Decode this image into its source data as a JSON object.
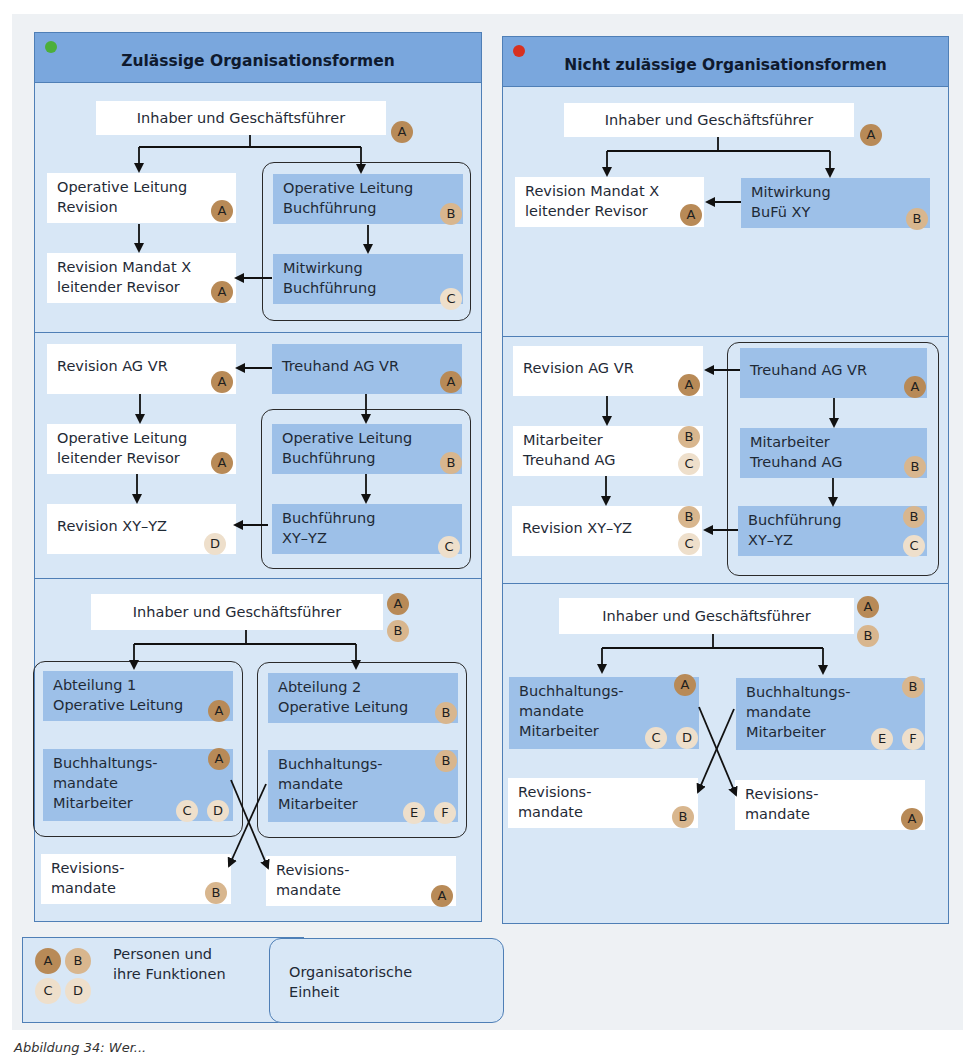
{
  "colors": {
    "header_bg": "#7aa7dd",
    "panel_bg": "#d8e7f6",
    "panel_border": "#4f7fb6",
    "node_blue": "#9dc0e8",
    "badge_A": "#b88a57",
    "badge_B": "#d8b68e",
    "badge_light": "#eedfcb",
    "dot_allowed": "#4caf3a",
    "dot_not_allowed": "#d8311f"
  },
  "left_panel": {
    "title": "Zulässige Organisationsformen",
    "status_icon": "green-dot",
    "sections": [
      {
        "nodes": [
          {
            "id": "owner",
            "text": "Inhaber und Geschäftsführer",
            "style": "white",
            "badges": [
              "A"
            ]
          },
          {
            "id": "op-rev",
            "text": "Operative Leitung\nRevision",
            "style": "white",
            "badges": [
              "A"
            ]
          },
          {
            "id": "rev-mandat",
            "text": "Revision Mandat X\nleitender Revisor",
            "style": "white",
            "badges": [
              "A"
            ]
          },
          {
            "id": "op-buch",
            "text": "Operative Leitung\nBuchführung",
            "style": "blue",
            "badges": [
              "B"
            ]
          },
          {
            "id": "mit-buch",
            "text": "Mitwirkung\nBuchführung",
            "style": "blue",
            "badges": [
              "C"
            ]
          }
        ]
      },
      {
        "nodes": [
          {
            "id": "rev-ag",
            "text": "Revision AG VR",
            "style": "white",
            "badges": [
              "A"
            ]
          },
          {
            "id": "treu-ag",
            "text": "Treuhand AG VR",
            "style": "blue",
            "badges": [
              "A"
            ]
          },
          {
            "id": "op-lead",
            "text": "Operative Leitung\nleitender Revisor",
            "style": "white",
            "badges": [
              "A"
            ]
          },
          {
            "id": "op-buch2",
            "text": "Operative Leitung\nBuchführung",
            "style": "blue",
            "badges": [
              "B"
            ]
          },
          {
            "id": "rev-xy",
            "text": "Revision XY–YZ",
            "style": "white",
            "badges": [
              "D"
            ]
          },
          {
            "id": "buch-xy",
            "text": "Buchführung\nXY–YZ",
            "style": "blue",
            "badges": [
              "C"
            ]
          }
        ]
      },
      {
        "nodes": [
          {
            "id": "owner3",
            "text": "Inhaber und Geschäftsführer",
            "style": "white",
            "badges": [
              "A",
              "B"
            ]
          },
          {
            "id": "abt1",
            "text": "Abteilung 1\nOperative Leitung",
            "style": "blue",
            "badges": [
              "A"
            ]
          },
          {
            "id": "abt2",
            "text": "Abteilung 2\nOperative Leitung",
            "style": "blue",
            "badges": [
              "B"
            ]
          },
          {
            "id": "bh1",
            "text": "Buchhaltungs-\nmandate\nMitarbeiter",
            "style": "blue",
            "badges": [
              "A",
              "C",
              "D"
            ]
          },
          {
            "id": "bh2",
            "text": "Buchhaltungs-\nmandate\nMitarbeiter",
            "style": "blue",
            "badges": [
              "B",
              "E",
              "F"
            ]
          },
          {
            "id": "revm1",
            "text": "Revisions-\nmandate",
            "style": "white",
            "badges": [
              "B"
            ]
          },
          {
            "id": "revm2",
            "text": "Revisions-\nmandate",
            "style": "white",
            "badges": [
              "A"
            ]
          }
        ]
      }
    ]
  },
  "right_panel": {
    "title": "Nicht zulässige Organisationsformen",
    "status_icon": "red-dot",
    "sections": [
      {
        "nodes": [
          {
            "id": "owner",
            "text": "Inhaber und Geschäftsführer",
            "style": "white",
            "badges": [
              "A"
            ]
          },
          {
            "id": "rev-mandat",
            "text": "Revision Mandat X\nleitender Revisor",
            "style": "white",
            "badges": [
              "A"
            ]
          },
          {
            "id": "mit-bufu",
            "text": "Mitwirkung\nBuFü XY",
            "style": "blue",
            "badges": [
              "B"
            ]
          }
        ]
      },
      {
        "nodes": [
          {
            "id": "rev-ag",
            "text": "Revision AG VR",
            "style": "white",
            "badges": [
              "A"
            ]
          },
          {
            "id": "treu-ag",
            "text": "Treuhand AG VR",
            "style": "blue",
            "badges": [
              "A"
            ]
          },
          {
            "id": "mitarb-l",
            "text": "Mitarbeiter\nTreuhand AG",
            "style": "white",
            "badges": [
              "B",
              "C"
            ]
          },
          {
            "id": "mitarb-r",
            "text": "Mitarbeiter\nTreuhand AG",
            "style": "blue",
            "badges": [
              "B"
            ]
          },
          {
            "id": "rev-xy",
            "text": "Revision XY–YZ",
            "style": "white",
            "badges": [
              "B",
              "C"
            ]
          },
          {
            "id": "buch-xy",
            "text": "Buchführung\nXY–YZ",
            "style": "blue",
            "badges": [
              "B",
              "C"
            ]
          }
        ]
      },
      {
        "nodes": [
          {
            "id": "owner3",
            "text": "Inhaber und Geschäftsführer",
            "style": "white",
            "badges": [
              "A",
              "B"
            ]
          },
          {
            "id": "bh1",
            "text": "Buchhaltungs-\nmandate\nMitarbeiter",
            "style": "blue",
            "badges": [
              "A",
              "C",
              "D"
            ]
          },
          {
            "id": "bh2",
            "text": "Buchhaltungs-\nmandate\nMitarbeiter",
            "style": "blue",
            "badges": [
              "B",
              "E",
              "F"
            ]
          },
          {
            "id": "revm1",
            "text": "Revisions-\nmandate",
            "style": "white",
            "badges": [
              "B"
            ]
          },
          {
            "id": "revm2",
            "text": "Revisions-\nmandate",
            "style": "white",
            "badges": [
              "A"
            ]
          }
        ]
      }
    ]
  },
  "legend": {
    "persons_label": "Personen und\nihre Funktionen",
    "persons_badges": [
      "A",
      "B",
      "C",
      "D"
    ],
    "unit_label": "Organisatorische\nEinheit"
  },
  "caption": "Abbildung 34: Wer..."
}
